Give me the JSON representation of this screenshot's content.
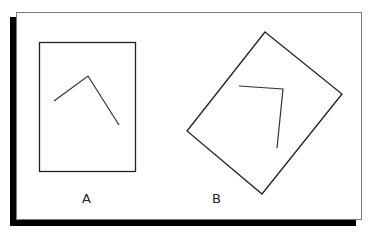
{
  "figure": {
    "colors": {
      "background": "#ffffff",
      "frame_border": "#7a7a7a",
      "shadow": "#000000",
      "stroke": "#222222"
    },
    "panels": [
      {
        "label": "A",
        "shape": "upright rectangle containing a bent line (angle)"
      },
      {
        "label": "B",
        "shape": "rotated rectangle containing a bent line (angle)"
      }
    ]
  }
}
